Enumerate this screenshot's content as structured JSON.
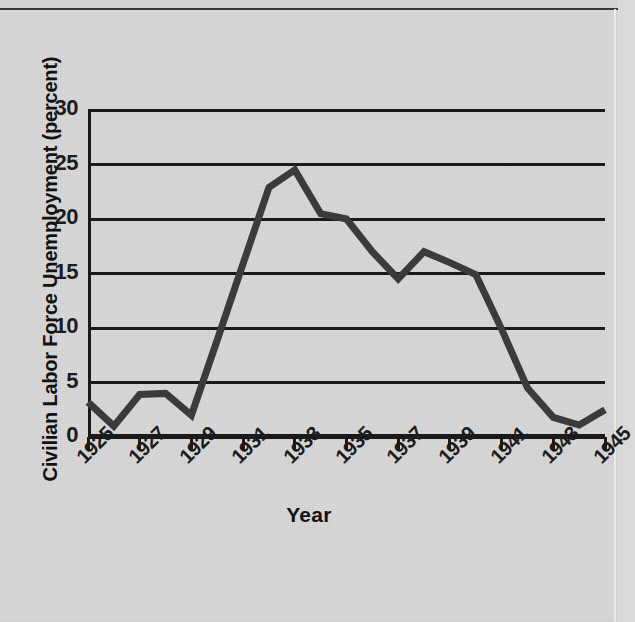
{
  "figure": {
    "background_color": "#d8d8d8",
    "ink_color": "#1a1a1a",
    "line_color": "#3b3b3b"
  },
  "axes": {
    "y_title": "Civilian Labor Force Unemployment (percent)",
    "x_title": "Year",
    "y_ticks": [
      "0",
      "5",
      "10",
      "15",
      "20",
      "25",
      "30"
    ],
    "x_ticks": [
      "1925",
      "1927",
      "1929",
      "1931",
      "1933",
      "1935",
      "1937",
      "1939",
      "1941",
      "1943",
      "1945"
    ]
  },
  "chart_data": {
    "type": "line",
    "title": "",
    "subtitle": "",
    "xlabel": "Year",
    "ylabel": "Civilian Labor Force Unemployment (percent)",
    "xlim": [
      1925,
      1945
    ],
    "ylim": [
      0,
      30
    ],
    "ytick_values": [
      0,
      5,
      10,
      15,
      20,
      25,
      30
    ],
    "xtick_values": [
      1925,
      1927,
      1929,
      1931,
      1933,
      1935,
      1937,
      1939,
      1941,
      1943,
      1945
    ],
    "grid": "horizontal",
    "legend": "none",
    "annotations": [],
    "x": [
      1925,
      1926,
      1927,
      1928,
      1929,
      1930,
      1931,
      1932,
      1933,
      1934,
      1935,
      1936,
      1937,
      1938,
      1939,
      1940,
      1941,
      1942,
      1943,
      1944,
      1945
    ],
    "values": [
      3.2,
      1.0,
      3.9,
      4.0,
      2.0,
      8.9,
      15.9,
      22.9,
      24.5,
      20.5,
      20.0,
      17.0,
      14.5,
      17.0,
      16.0,
      14.9,
      9.9,
      4.5,
      1.8,
      1.1,
      2.5
    ],
    "series": [
      {
        "name": "Civilian Labor Force Unemployment",
        "color": "#3b3b3b",
        "values": [
          3.2,
          1.0,
          3.9,
          4.0,
          2.0,
          8.9,
          15.9,
          22.9,
          24.5,
          20.5,
          20.0,
          17.0,
          14.5,
          17.0,
          16.0,
          14.9,
          9.9,
          4.5,
          1.8,
          1.1,
          2.5
        ]
      }
    ]
  }
}
